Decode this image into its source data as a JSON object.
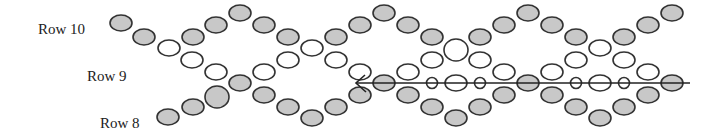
{
  "diagram": {
    "colors": {
      "shaded_fill": "#c8c8c8",
      "white_fill": "#ffffff",
      "stroke": "#333333",
      "thread": "#222222"
    },
    "labels": [
      {
        "text": "Row 10",
        "x": 38,
        "y": 22
      },
      {
        "text": "Row 9",
        "x": 87,
        "y": 69
      },
      {
        "text": "Row 8",
        "x": 100,
        "y": 116
      }
    ],
    "thread_line": {
      "x1": 356,
      "y1": 83,
      "x2": 690,
      "y2": 83,
      "direction": "left"
    },
    "beads": [
      {
        "x": 121,
        "y": 23,
        "type": "shaded"
      },
      {
        "x": 144,
        "y": 37,
        "type": "shaded"
      },
      {
        "x": 169,
        "y": 48,
        "type": "white"
      },
      {
        "x": 193,
        "y": 37,
        "type": "shaded"
      },
      {
        "x": 216,
        "y": 25,
        "type": "shaded"
      },
      {
        "x": 240,
        "y": 13,
        "type": "shaded"
      },
      {
        "x": 264,
        "y": 25,
        "type": "shaded"
      },
      {
        "x": 288,
        "y": 37,
        "type": "shaded"
      },
      {
        "x": 312,
        "y": 48,
        "type": "white"
      },
      {
        "x": 336,
        "y": 37,
        "type": "shaded"
      },
      {
        "x": 360,
        "y": 25,
        "type": "shaded"
      },
      {
        "x": 384,
        "y": 13,
        "type": "shaded"
      },
      {
        "x": 408,
        "y": 25,
        "type": "shaded"
      },
      {
        "x": 432,
        "y": 37,
        "type": "shaded"
      },
      {
        "x": 456,
        "y": 50,
        "type": "white",
        "size": "large"
      },
      {
        "x": 480,
        "y": 37,
        "type": "shaded"
      },
      {
        "x": 504,
        "y": 25,
        "type": "shaded"
      },
      {
        "x": 528,
        "y": 13,
        "type": "shaded"
      },
      {
        "x": 552,
        "y": 25,
        "type": "shaded"
      },
      {
        "x": 576,
        "y": 37,
        "type": "shaded"
      },
      {
        "x": 600,
        "y": 48,
        "type": "white"
      },
      {
        "x": 624,
        "y": 37,
        "type": "shaded"
      },
      {
        "x": 648,
        "y": 25,
        "type": "shaded"
      },
      {
        "x": 672,
        "y": 13,
        "type": "shaded"
      },
      {
        "x": 192,
        "y": 60,
        "type": "white"
      },
      {
        "x": 216,
        "y": 72,
        "type": "white"
      },
      {
        "x": 264,
        "y": 72,
        "type": "white"
      },
      {
        "x": 288,
        "y": 60,
        "type": "white"
      },
      {
        "x": 336,
        "y": 60,
        "type": "white"
      },
      {
        "x": 360,
        "y": 72,
        "type": "white"
      },
      {
        "x": 408,
        "y": 72,
        "type": "white"
      },
      {
        "x": 432,
        "y": 60,
        "type": "white"
      },
      {
        "x": 480,
        "y": 60,
        "type": "white"
      },
      {
        "x": 504,
        "y": 72,
        "type": "white"
      },
      {
        "x": 552,
        "y": 72,
        "type": "white"
      },
      {
        "x": 576,
        "y": 60,
        "type": "white"
      },
      {
        "x": 624,
        "y": 60,
        "type": "white"
      },
      {
        "x": 648,
        "y": 72,
        "type": "white"
      },
      {
        "x": 240,
        "y": 83,
        "type": "shaded"
      },
      {
        "x": 384,
        "y": 83,
        "type": "shaded"
      },
      {
        "x": 432,
        "y": 83,
        "type": "white",
        "size": "small"
      },
      {
        "x": 456,
        "y": 83,
        "type": "white"
      },
      {
        "x": 480,
        "y": 83,
        "type": "white",
        "size": "small"
      },
      {
        "x": 528,
        "y": 83,
        "type": "shaded"
      },
      {
        "x": 576,
        "y": 83,
        "type": "white",
        "size": "small"
      },
      {
        "x": 600,
        "y": 83,
        "type": "white"
      },
      {
        "x": 624,
        "y": 83,
        "type": "white",
        "size": "small"
      },
      {
        "x": 672,
        "y": 83,
        "type": "shaded"
      },
      {
        "x": 168,
        "y": 117,
        "type": "shaded"
      },
      {
        "x": 193,
        "y": 107,
        "type": "shaded"
      },
      {
        "x": 217,
        "y": 97,
        "type": "shaded",
        "size": "large"
      },
      {
        "x": 264,
        "y": 95,
        "type": "shaded"
      },
      {
        "x": 288,
        "y": 107,
        "type": "shaded"
      },
      {
        "x": 312,
        "y": 118,
        "type": "shaded"
      },
      {
        "x": 336,
        "y": 107,
        "type": "shaded"
      },
      {
        "x": 360,
        "y": 95,
        "type": "shaded"
      },
      {
        "x": 408,
        "y": 95,
        "type": "shaded"
      },
      {
        "x": 432,
        "y": 107,
        "type": "shaded"
      },
      {
        "x": 456,
        "y": 118,
        "type": "shaded"
      },
      {
        "x": 480,
        "y": 107,
        "type": "shaded"
      },
      {
        "x": 504,
        "y": 95,
        "type": "shaded"
      },
      {
        "x": 552,
        "y": 95,
        "type": "shaded"
      },
      {
        "x": 576,
        "y": 107,
        "type": "shaded"
      },
      {
        "x": 600,
        "y": 118,
        "type": "shaded"
      },
      {
        "x": 624,
        "y": 107,
        "type": "shaded"
      },
      {
        "x": 648,
        "y": 95,
        "type": "shaded"
      }
    ]
  }
}
